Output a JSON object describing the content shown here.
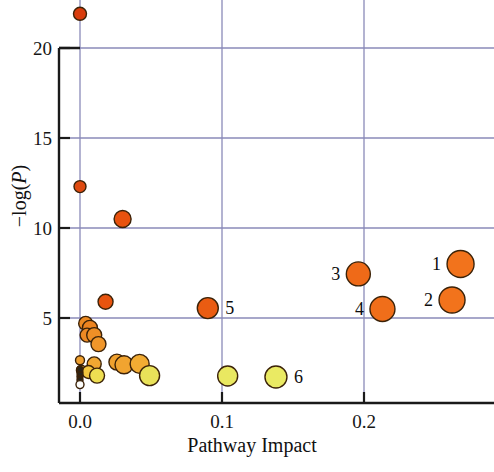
{
  "chart_data": {
    "type": "scatter",
    "title": "",
    "xlabel": "Pathway Impact",
    "ylabel": "−log(P)",
    "xlim": [
      -0.02,
      0.375
    ],
    "ylim": [
      0.6,
      22.8
    ],
    "xticks": [
      0.0,
      0.1,
      0.2,
      0.3
    ],
    "xticklabels": [
      "0.0",
      "0.1",
      "0.2",
      "0.3"
    ],
    "yticks": [
      5,
      10,
      15,
      20
    ],
    "yticklabels": [
      "5",
      "10",
      "15",
      "20"
    ],
    "grid": true,
    "grid_color": "#8a8ab8",
    "legend": "none",
    "marker_colormap": [
      "#f2ef6a",
      "#f5d93c",
      "#f2a82c",
      "#ee7d1e",
      "#e8520f",
      "#cf3108"
    ],
    "size_note": "marker radius encodes pathway impact",
    "points": [
      {
        "x": 0.0,
        "y": 21.9,
        "r": 6.5,
        "color": "#d93c0c",
        "label": ""
      },
      {
        "x": 0.0,
        "y": 12.3,
        "r": 6.0,
        "color": "#df4a10",
        "label": ""
      },
      {
        "x": 0.03,
        "y": 10.5,
        "r": 8.5,
        "color": "#e8520f",
        "label": ""
      },
      {
        "x": 0.018,
        "y": 5.9,
        "r": 7.5,
        "color": "#e8540f",
        "label": ""
      },
      {
        "x": 0.09,
        "y": 5.55,
        "r": 10.5,
        "color": "#ea5c12",
        "label": "5"
      },
      {
        "x": 0.196,
        "y": 7.45,
        "r": 12.0,
        "color": "#ef6a18",
        "label": "3"
      },
      {
        "x": 0.213,
        "y": 5.5,
        "r": 12.5,
        "color": "#f06e1a",
        "label": "4"
      },
      {
        "x": 0.268,
        "y": 8.0,
        "r": 13.5,
        "color": "#f2731c",
        "label": "1"
      },
      {
        "x": 0.262,
        "y": 6.0,
        "r": 13.0,
        "color": "#f2731c",
        "label": "2"
      },
      {
        "x": 0.004,
        "y": 4.7,
        "r": 7.0,
        "color": "#ed8a22",
        "label": ""
      },
      {
        "x": 0.007,
        "y": 4.45,
        "r": 7.5,
        "color": "#ed8420",
        "label": ""
      },
      {
        "x": 0.005,
        "y": 4.05,
        "r": 7.0,
        "color": "#ee8a24",
        "label": ""
      },
      {
        "x": 0.01,
        "y": 4.05,
        "r": 7.5,
        "color": "#ef8f26",
        "label": ""
      },
      {
        "x": 0.013,
        "y": 3.55,
        "r": 7.5,
        "color": "#f0962a",
        "label": ""
      },
      {
        "x": 0.0,
        "y": 2.65,
        "r": 4.5,
        "color": "#efa02f",
        "label": ""
      },
      {
        "x": 0.01,
        "y": 2.45,
        "r": 7.0,
        "color": "#f0a732",
        "label": ""
      },
      {
        "x": 0.001,
        "y": 2.1,
        "r": 5.0,
        "color": "#f2bb3a",
        "label": ""
      },
      {
        "x": 0.006,
        "y": 2.0,
        "r": 6.5,
        "color": "#f3c63e",
        "label": ""
      },
      {
        "x": 0.012,
        "y": 1.8,
        "r": 7.5,
        "color": "#eede52",
        "label": ""
      },
      {
        "x": 0.026,
        "y": 2.55,
        "r": 8.0,
        "color": "#f0a12e",
        "label": ""
      },
      {
        "x": 0.031,
        "y": 2.4,
        "r": 9.0,
        "color": "#f1a430",
        "label": ""
      },
      {
        "x": 0.042,
        "y": 2.45,
        "r": 9.5,
        "color": "#f2ac33",
        "label": ""
      },
      {
        "x": 0.049,
        "y": 1.8,
        "r": 10.0,
        "color": "#e9e259",
        "label": ""
      },
      {
        "x": 0.104,
        "y": 1.78,
        "r": 10.0,
        "color": "#e9e861",
        "label": ""
      },
      {
        "x": 0.138,
        "y": 1.72,
        "r": 11.0,
        "color": "#eaea63",
        "label": "6"
      },
      {
        "x": 0.0,
        "y": 1.75,
        "r": 3.0,
        "color": "#2a2419",
        "label": ""
      },
      {
        "x": 0.0,
        "y": 1.95,
        "r": 3.0,
        "color": "#2a2419",
        "label": ""
      },
      {
        "x": 0.0,
        "y": 2.15,
        "r": 3.0,
        "color": "#2a2419",
        "label": ""
      },
      {
        "x": 0.0,
        "y": 1.55,
        "r": 3.0,
        "color": "#2a2419",
        "label": ""
      },
      {
        "x": 0.0,
        "y": 1.3,
        "r": 4.0,
        "color": "#fdfdfb",
        "label": ""
      }
    ]
  },
  "axis": {
    "x_title": "Pathway Impact",
    "y_title_prefix": "−log(",
    "y_title_italic": "P",
    "y_title_suffix": ")"
  }
}
